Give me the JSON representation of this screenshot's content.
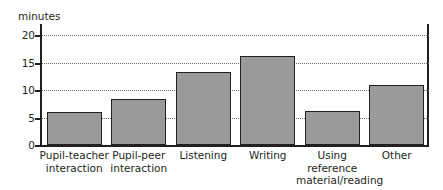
{
  "chart_data": {
    "type": "bar",
    "title": "",
    "subtitle": "",
    "xlabel": "",
    "ylabel": "minutes",
    "ylim": [
      0,
      22
    ],
    "yticks": [
      0,
      5,
      10,
      15,
      20
    ],
    "ytick_labels": [
      "0",
      "5",
      "10",
      "15",
      "20"
    ],
    "grid": true,
    "grid_axis": "y",
    "legend": false,
    "legend_position": "none",
    "categories": [
      "Pupil-teacher interaction",
      "Pupil-peer interaction",
      "Listening",
      "Writing",
      "Using reference material/reading",
      "Other"
    ],
    "category_lines": [
      [
        "Pupil-teacher",
        "interaction"
      ],
      [
        "Pupil-peer",
        "interaction"
      ],
      [
        "Listening"
      ],
      [
        "Writing"
      ],
      [
        "Using",
        "reference",
        "material/reading"
      ],
      [
        "Other"
      ]
    ],
    "values": [
      6,
      8.3,
      13.2,
      16.2,
      6.2,
      11
    ],
    "bar_color": "#9a9a9a",
    "bar_edge_color": "#231f20",
    "axis_color": "#231f20",
    "grid_color": "#6d6e71",
    "background": "#ffffff"
  }
}
